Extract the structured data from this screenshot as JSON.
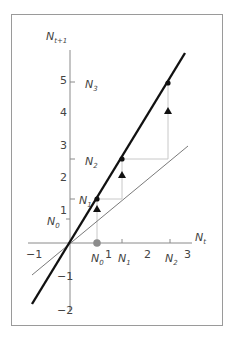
{
  "diagram": {
    "type": "cobweb-growth-diagram",
    "axes": {
      "x_label": "N",
      "x_label_sub": "t",
      "y_label": "N",
      "y_label_sub": "t+1",
      "x_ticks": [
        {
          "value": -1,
          "label": "−1"
        },
        {
          "value": 1,
          "label": "1"
        },
        {
          "value": 2,
          "label": "2"
        },
        {
          "value": 3,
          "label": "3"
        }
      ],
      "y_ticks": [
        {
          "value": 5,
          "label": "5"
        },
        {
          "value": 4,
          "label": "4"
        },
        {
          "value": 3,
          "label": "3"
        },
        {
          "value": 2,
          "label": "2"
        },
        {
          "value": 1,
          "label": "1"
        },
        {
          "value": -1,
          "label": "−1"
        },
        {
          "value": -2,
          "label": "−2"
        }
      ]
    },
    "x_markers": [
      {
        "name": "N",
        "sub": "0",
        "value": 0.67
      },
      {
        "name": "N",
        "sub": "1",
        "value": 1.3
      },
      {
        "name": "N",
        "sub": "2",
        "value": 2.55
      }
    ],
    "y_markers": [
      {
        "name": "N",
        "sub": "0",
        "value": 0.75
      },
      {
        "name": "N",
        "sub": "1",
        "value": 1.35
      },
      {
        "name": "N",
        "sub": "2",
        "value": 2.55
      },
      {
        "name": "N",
        "sub": "3",
        "value": 4.9
      }
    ],
    "lines": [
      {
        "name": "growth-line",
        "slope": 1.95,
        "style": "thick",
        "color": "#111111"
      },
      {
        "name": "replacement-line",
        "slope": 1.0,
        "style": "thin",
        "color": "#777777"
      }
    ],
    "points": [
      {
        "x": 0.67,
        "y": 1.35,
        "marker": "dot"
      },
      {
        "x": 1.3,
        "y": 2.55,
        "marker": "dot"
      },
      {
        "x": 2.55,
        "y": 4.9,
        "marker": "dot"
      },
      {
        "x": 0.67,
        "y": 0.99,
        "marker": "triangle"
      },
      {
        "x": 1.3,
        "y": 2.07,
        "marker": "triangle"
      },
      {
        "x": 2.55,
        "y": 4.0,
        "marker": "triangle"
      },
      {
        "x": 0.67,
        "y": 0,
        "marker": "grey-circle"
      }
    ],
    "colors": {
      "axis": "#8a8a8a",
      "thick_line": "#111111",
      "thin_line": "#7a7a7a",
      "guide": "#c8c8c8",
      "start_circle": "#8c8c8c",
      "frame": "#9a9a9a"
    }
  }
}
